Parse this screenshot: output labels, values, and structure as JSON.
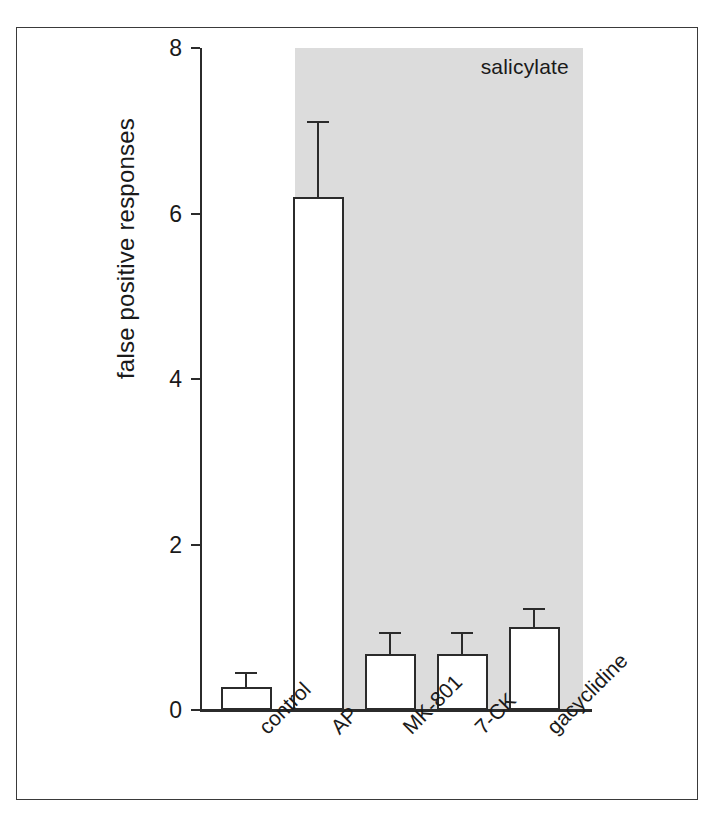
{
  "figure": {
    "background_color": "#ffffff",
    "frame_color": "#3a3a3a",
    "axis_color": "#2b2b2b",
    "band_color": "#dcdcdc"
  },
  "chart_data": {
    "type": "bar",
    "title": "",
    "subtitle": "",
    "xlabel": "",
    "ylabel": "false positive responses",
    "categories": [
      "control",
      "AP",
      "MK-801",
      "7-CK",
      "gacyclidine"
    ],
    "values": [
      0.28,
      6.2,
      0.68,
      0.68,
      1.0
    ],
    "errors_upper": [
      0.45,
      7.1,
      0.93,
      0.93,
      1.22
    ],
    "error_type": "upper-only error bar",
    "ylim": [
      0,
      8
    ],
    "yticks": [
      0,
      2,
      4,
      6,
      8
    ],
    "ytick_labels": [
      "0",
      "2",
      "4",
      "6",
      "8"
    ],
    "grid": false,
    "legend": null,
    "bar_fill": "#ffffff",
    "bar_edge": "#2b2b2b",
    "annotations": [
      {
        "text": "salicylate",
        "type": "shaded-region-label",
        "covers_categories": [
          "AP",
          "MK-801",
          "7-CK",
          "gacyclidine"
        ],
        "position": "top-right of shaded band"
      }
    ]
  },
  "axis": {
    "y_title": "false positive responses",
    "ticks": [
      {
        "label": "8",
        "value": 8
      },
      {
        "label": "6",
        "value": 6
      },
      {
        "label": "4",
        "value": 4
      },
      {
        "label": "2",
        "value": 2
      },
      {
        "label": "0",
        "value": 0
      }
    ]
  },
  "band": {
    "label": "salicylate"
  },
  "bars": [
    {
      "label": "control",
      "value": 0.28,
      "error_upper": 0.45
    },
    {
      "label": "AP",
      "value": 6.2,
      "error_upper": 7.1
    },
    {
      "label": "MK-801",
      "value": 0.68,
      "error_upper": 0.93
    },
    {
      "label": "7-CK",
      "value": 0.68,
      "error_upper": 0.93
    },
    {
      "label": "gacyclidine",
      "value": 1.0,
      "error_upper": 1.22
    }
  ]
}
